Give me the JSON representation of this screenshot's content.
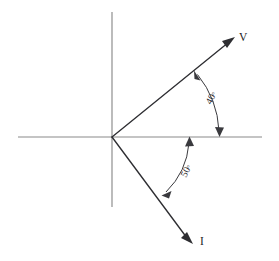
{
  "figure": {
    "background_color": "#ffffff",
    "width": 279,
    "height": 261
  },
  "colors": {
    "axis": "#8a8a8a",
    "vector": "#2e2e32",
    "arc": "#3a3a3e",
    "text": "#232326"
  },
  "axes": {
    "origin": {
      "x": 112,
      "y": 137
    },
    "horizontal": {
      "label": "",
      "x_start": 18,
      "x_end": 262,
      "y": 137
    },
    "vertical": {
      "label": "",
      "y_start": 12,
      "y_end": 207,
      "x": 112
    }
  },
  "vectors": [
    {
      "name": "voltage-phasor",
      "label": "V",
      "angle_deg": 40,
      "direction": "leading",
      "label_x": 239,
      "label_y": 41,
      "tip_x": 234,
      "tip_y": 38
    },
    {
      "name": "current-phasor",
      "label": "I",
      "angle_deg": -50,
      "direction": "lagging",
      "label_x": 200,
      "label_y": 245,
      "tip_x": 192,
      "tip_y": 243
    }
  ],
  "angle_arcs": [
    {
      "name": "angle-v-to-axis",
      "label": "40",
      "degree_symbol": "°",
      "value_deg": 40,
      "from": "voltage-phasor",
      "to": "positive-x-axis",
      "radius": 97,
      "label_x": 211,
      "label_y": 105,
      "label_rotation": -62
    },
    {
      "name": "angle-axis-to-i",
      "label": "50",
      "degree_symbol": "°",
      "value_deg": 50,
      "from": "positive-x-axis",
      "to": "current-phasor",
      "radius": 77,
      "label_x": 186,
      "label_y": 178,
      "label_rotation": -62
    }
  ]
}
